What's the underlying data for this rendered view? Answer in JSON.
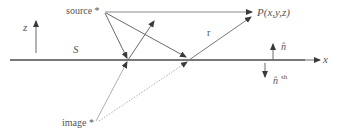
{
  "diagram": {
    "labels": {
      "source": "source *",
      "image": "image *",
      "point": "P(x,y,z)",
      "r": "r",
      "surface": "S",
      "z_axis": "z",
      "x_axis": "x",
      "normal": "n̂",
      "normal_sh": "n̂",
      "normal_sh_sup": "sh"
    },
    "colors": {
      "surface_line": "#4a4a4a",
      "ray": "#6a6a6a",
      "image_ray": "#9a9a9a",
      "text": "#555555"
    }
  }
}
